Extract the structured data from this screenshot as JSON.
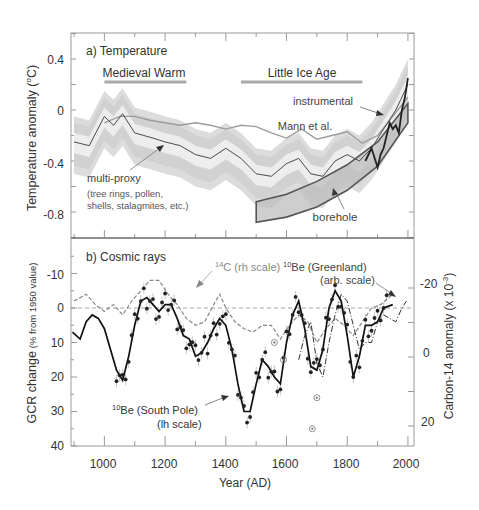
{
  "chart_data": [
    {
      "type": "line",
      "panel": "a",
      "title": "a) Temperature",
      "xlabel": "",
      "ylabel": "Temperature anomaly (°C)",
      "ylabel_parts": {
        "main": "Temperature anomaly (",
        "sup": "o",
        "tail": "C)"
      },
      "xlim": [
        890,
        2020
      ],
      "ylim": [
        -1.0,
        0.6
      ],
      "yticks": [
        0.4,
        0,
        -0.4,
        -0.8
      ],
      "ytick_labels": [
        "0.4",
        "0",
        "-0.4",
        "-0.8"
      ],
      "annotations": {
        "medieval_warm": "Medieval Warm",
        "little_ice_age": "Little Ice Age",
        "instrumental": "instrumental",
        "mann": "Mann et al.",
        "multiproxy": "multi-proxy",
        "multiproxy_sub1": "(tree rings, pollen,",
        "multiproxy_sub2": "shells, stalagmites, etc.)",
        "borehole": "borehole"
      },
      "periods": [
        {
          "name": "Medieval Warm",
          "start": 1000,
          "end": 1270
        },
        {
          "name": "Little Ice Age",
          "start": 1450,
          "end": 1850
        }
      ],
      "series": [
        {
          "name": "multi-proxy",
          "x": [
            900,
            950,
            1000,
            1030,
            1060,
            1100,
            1130,
            1160,
            1200,
            1250,
            1300,
            1350,
            1400,
            1450,
            1500,
            1550,
            1600,
            1640,
            1680,
            1720,
            1760,
            1800,
            1840,
            1880,
            1920,
            1960,
            2000
          ],
          "values": [
            -0.25,
            -0.28,
            -0.05,
            -0.12,
            -0.03,
            -0.18,
            -0.2,
            -0.22,
            -0.25,
            -0.28,
            -0.35,
            -0.38,
            -0.3,
            -0.38,
            -0.5,
            -0.52,
            -0.42,
            -0.38,
            -0.5,
            -0.52,
            -0.4,
            -0.35,
            -0.4,
            -0.3,
            -0.15,
            0.0,
            0.2
          ]
        },
        {
          "name": "Mann et al.",
          "x": [
            1000,
            1050,
            1100,
            1150,
            1200,
            1250,
            1300,
            1350,
            1400,
            1450,
            1500,
            1550,
            1600,
            1650,
            1700,
            1750,
            1800,
            1850,
            1900,
            1950,
            2000
          ],
          "values": [
            -0.1,
            -0.05,
            -0.05,
            -0.08,
            -0.1,
            -0.12,
            -0.1,
            -0.12,
            -0.15,
            -0.12,
            -0.13,
            -0.18,
            -0.22,
            -0.15,
            -0.23,
            -0.2,
            -0.17,
            -0.26,
            -0.2,
            -0.05,
            0.1
          ]
        },
        {
          "name": "borehole (upper)",
          "x": [
            1500,
            1600,
            1700,
            1800,
            1900,
            2000
          ],
          "values": [
            -0.72,
            -0.66,
            -0.56,
            -0.43,
            -0.25,
            0.05
          ]
        },
        {
          "name": "borehole (lower)",
          "x": [
            1500,
            1600,
            1700,
            1800,
            1900,
            2000
          ],
          "values": [
            -0.88,
            -0.84,
            -0.76,
            -0.63,
            -0.44,
            -0.1
          ]
        },
        {
          "name": "instrumental",
          "x": [
            1860,
            1880,
            1900,
            1910,
            1920,
            1940,
            1950,
            1960,
            1970,
            1980,
            1990,
            2000
          ],
          "values": [
            -0.4,
            -0.3,
            -0.45,
            -0.35,
            -0.3,
            -0.1,
            -0.15,
            -0.12,
            -0.18,
            0.0,
            0.1,
            0.25
          ]
        }
      ]
    },
    {
      "type": "line",
      "panel": "b",
      "title": "b) Cosmic rays",
      "xlabel": "Year (AD)",
      "ylabel": "GCR change (% from 1950 value)",
      "ylabel_main": "GCR change",
      "ylabel_paren": "(% from 1950 value)",
      "y2label": "Carbon-14 anomaly (x 10-3)",
      "y2label_parts": {
        "main": "Carbon-14 anomaly (x 10",
        "sup": "-3",
        "tail": ")"
      },
      "xlim": [
        890,
        2020
      ],
      "ylim_inverted": [
        -20,
        40
      ],
      "yticks": [
        -10,
        0,
        10,
        20,
        30,
        40
      ],
      "ytick_labels": [
        "-10",
        "0",
        "10",
        "20",
        "30",
        "40"
      ],
      "y2ticks": [
        -20,
        0,
        20
      ],
      "y2tick_labels": [
        "-20",
        "0",
        "20"
      ],
      "xticks": [
        1000,
        1200,
        1400,
        1600,
        1800,
        2000
      ],
      "xtick_labels": [
        "1000",
        "1200",
        "1400",
        "1600",
        "1800",
        "2000"
      ],
      "annotations": {
        "c14_pre": "14",
        "c14_label": "C (rh scale)",
        "be_greenland_pre": "10",
        "be_greenland_label": "Be (Greenland)",
        "be_greenland_sub": "(arb. scale)",
        "be_southpole_pre": "10",
        "be_southpole_label": "Be (South Pole)",
        "be_southpole_sub": "(lh scale)"
      },
      "series": [
        {
          "name": "10Be (South Pole) (lh scale)",
          "x": [
            895,
            920,
            940,
            960,
            980,
            1000,
            1020,
            1040,
            1060,
            1080,
            1100,
            1120,
            1140,
            1160,
            1180,
            1200,
            1220,
            1240,
            1260,
            1280,
            1300,
            1320,
            1340,
            1360,
            1380,
            1400,
            1420,
            1440,
            1460,
            1480,
            1500,
            1520,
            1540,
            1560,
            1580,
            1600,
            1620,
            1640,
            1660,
            1680,
            1700,
            1720,
            1740,
            1760,
            1780,
            1800,
            1820,
            1840,
            1860,
            1880,
            1900,
            1920,
            1950
          ],
          "values": [
            7,
            9,
            4,
            2,
            3,
            6,
            12,
            18,
            21,
            14,
            5,
            -2,
            -3,
            -1,
            1,
            -1,
            -1,
            3,
            8,
            9,
            14,
            13,
            10,
            6,
            3,
            5,
            12,
            22,
            30,
            30,
            22,
            15,
            17,
            20,
            22,
            10,
            2,
            -2,
            6,
            17,
            18,
            12,
            0,
            -5,
            -2,
            8,
            20,
            14,
            5,
            5,
            4,
            0,
            -1
          ]
        },
        {
          "name": "14C (rh scale)",
          "x": [
            900,
            940,
            970,
            1000,
            1030,
            1060,
            1090,
            1120,
            1150,
            1180,
            1210,
            1240,
            1270,
            1300,
            1330,
            1360,
            1380,
            1400,
            1430,
            1460,
            1490,
            1520,
            1550,
            1580,
            1610,
            1640,
            1670,
            1700,
            1730,
            1760,
            1790,
            1820,
            1850,
            1880,
            1910,
            1950
          ],
          "values": [
            -2,
            -4,
            -1,
            1,
            -1,
            2,
            -2,
            -5,
            -8,
            -8,
            -4,
            -1,
            3,
            5,
            4,
            -1,
            -4,
            0,
            4,
            6,
            7,
            5,
            5,
            9,
            5,
            2,
            4,
            10,
            6,
            3,
            5,
            8,
            4,
            0,
            -1,
            -4
          ]
        },
        {
          "name": "10Be (Greenland) (arb. scale)",
          "x": [
            1640,
            1660,
            1680,
            1700,
            1720,
            1740,
            1760,
            1780,
            1800,
            1820,
            1840,
            1860,
            1880,
            1900,
            1920,
            1940,
            1960,
            1980,
            1995
          ],
          "values": [
            15,
            8,
            4,
            16,
            20,
            10,
            2,
            -4,
            -2,
            5,
            12,
            10,
            10,
            4,
            2,
            3,
            4,
            0,
            -2
          ]
        }
      ]
    }
  ]
}
